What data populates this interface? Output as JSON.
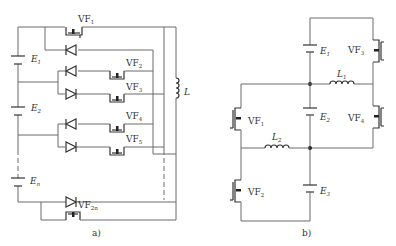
{
  "figure_a": {
    "caption": "a)",
    "batteries": [
      {
        "name": "E",
        "sub": "1"
      },
      {
        "name": "E",
        "sub": "2"
      },
      {
        "name": "E",
        "sub": "n"
      }
    ],
    "switches": [
      {
        "name": "VF",
        "sub": "1"
      },
      {
        "name": "VF",
        "sub": "2"
      },
      {
        "name": "VF",
        "sub": "3"
      },
      {
        "name": "VF",
        "sub": "4"
      },
      {
        "name": "VF",
        "sub": "5"
      },
      {
        "name": "VF",
        "sub": "2n"
      }
    ],
    "inductor": {
      "name": "L"
    }
  },
  "figure_b": {
    "caption": "b)",
    "batteries": [
      {
        "name": "E",
        "sub": "1"
      },
      {
        "name": "E",
        "sub": "2"
      },
      {
        "name": "E",
        "sub": "3"
      }
    ],
    "switches": [
      {
        "name": "VF",
        "sub": "1"
      },
      {
        "name": "VF",
        "sub": "2"
      },
      {
        "name": "VF",
        "sub": "3"
      },
      {
        "name": "VF",
        "sub": "4"
      }
    ],
    "inductors": [
      {
        "name": "L",
        "sub": "1"
      },
      {
        "name": "L",
        "sub": "2"
      }
    ]
  },
  "colors": {
    "wire": "#6b6b6b",
    "device": "#333333",
    "background": "#ffffff"
  }
}
